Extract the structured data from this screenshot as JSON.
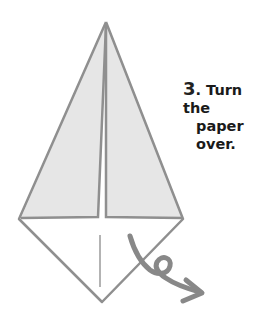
{
  "instruction": {
    "step_number": "3",
    "text_line1": ". Turn the",
    "text_line2": "paper over."
  },
  "colors": {
    "fold_fill": "#e6e6e6",
    "line": "#8f8f8f",
    "arrow": "#888888",
    "background": "#ffffff"
  }
}
